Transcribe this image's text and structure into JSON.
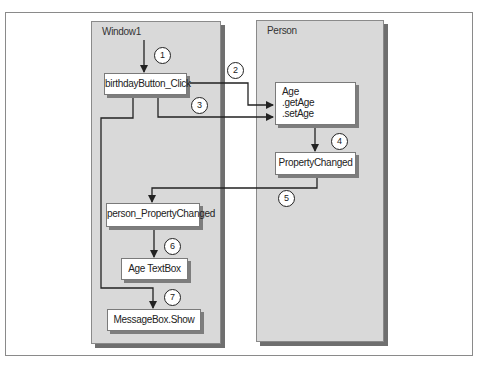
{
  "panels": {
    "window1": {
      "title": "Window1"
    },
    "person": {
      "title": "Person"
    }
  },
  "boxes": {
    "birthday_button_click": "birthdayButton_Click",
    "age": {
      "lines": [
        "Age",
        ".getAge",
        ".setAge"
      ]
    },
    "property_changed": "PropertyChanged",
    "person_property_changed": "person_PropertyChanged",
    "age_textbox": "Age TextBox",
    "messagebox_show": "MessageBox.Show"
  },
  "steps": [
    "1",
    "2",
    "3",
    "4",
    "5",
    "6",
    "7"
  ],
  "flow": [
    {
      "step": "1",
      "from": "start",
      "to": "birthdayButton_Click"
    },
    {
      "step": "2",
      "from": "birthdayButton_Click",
      "to": ".getAge"
    },
    {
      "step": "3",
      "from": "birthdayButton_Click",
      "to": ".setAge"
    },
    {
      "step": "4",
      "from": "Age",
      "to": "PropertyChanged"
    },
    {
      "step": "5",
      "from": "PropertyChanged",
      "to": "person_PropertyChanged"
    },
    {
      "step": "6",
      "from": "person_PropertyChanged",
      "to": "Age TextBox"
    },
    {
      "step": "7",
      "from": "birthdayButton_Click",
      "to": "MessageBox.Show"
    }
  ],
  "colors": {
    "panel": "#d9d9d9",
    "line": "#222222",
    "box": "#ffffff"
  }
}
